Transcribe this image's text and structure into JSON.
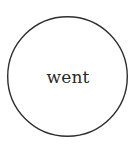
{
  "diagram": {
    "nodes": [
      {
        "id": "went",
        "label": "went",
        "shape": "circle",
        "stroke_color": "#2e2e2e",
        "fill_color": "#ffffff",
        "text_color": "#2a2a2a"
      }
    ],
    "edges": []
  }
}
